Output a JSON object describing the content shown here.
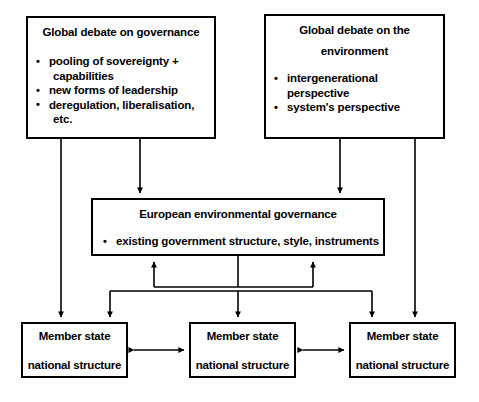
{
  "diagram": {
    "type": "flow-diagram",
    "title_text": "European environmental governance framework",
    "line_color": "#000000",
    "background_color": "#ffffff",
    "boxes": {
      "governance": {
        "title": "Global debate on governance",
        "bullets": [
          {
            "text": "pooling of sovereignty +",
            "continuation": "capabilities"
          },
          {
            "text": "new forms of leadership",
            "continuation": ""
          },
          {
            "text": "deregulation, liberalisation,",
            "continuation": "etc."
          }
        ]
      },
      "environment": {
        "title_line1": "Global debate on the",
        "title_line2": "environment",
        "bullets": [
          {
            "text": "intergenerational perspective",
            "continuation": ""
          },
          {
            "text": "system's perspective",
            "continuation": ""
          }
        ]
      },
      "european_environmental_governance": {
        "title": "European environmental governance",
        "bullets": [
          {
            "text": "existing government structure, style, instruments",
            "continuation": ""
          }
        ]
      },
      "member_states": [
        {
          "title": "Member state",
          "subtitle": "national structure"
        },
        {
          "title": "Member state",
          "subtitle": "national structure"
        },
        {
          "title": "Member state",
          "subtitle": "national structure"
        }
      ]
    },
    "connectors": [
      {
        "name": "governance-to-member-state-1",
        "style": "single-arrow-down"
      },
      {
        "name": "governance-to-eeg",
        "style": "single-arrow-down"
      },
      {
        "name": "environment-to-eeg",
        "style": "single-arrow-down"
      },
      {
        "name": "environment-to-member-state-3",
        "style": "single-arrow-down"
      },
      {
        "name": "member-states-to-eeg-bus",
        "style": "bus-arrows-up"
      },
      {
        "name": "eeg-to-member-states-bus",
        "style": "bus-arrows-down"
      },
      {
        "name": "member-state-1-to-2",
        "style": "double-arrow-horizontal"
      },
      {
        "name": "member-state-2-to-3",
        "style": "double-arrow-horizontal"
      }
    ]
  }
}
